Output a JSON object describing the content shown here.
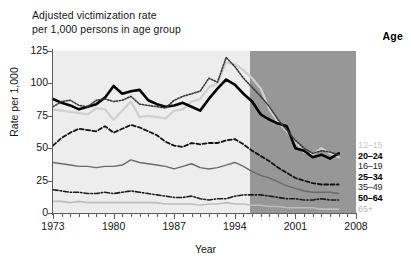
{
  "title": {
    "line1": "Adjusted victimization rate",
    "line2": "per 1,000 persons in age group"
  },
  "legend": {
    "header": "Age",
    "items": [
      {
        "label": "12–15",
        "style": "faint",
        "color": "#d0d0d0"
      },
      {
        "label": "20–24",
        "style": "bold",
        "color": "#000000"
      },
      {
        "label": "16–19",
        "style": "plain",
        "color": "#2a2a2a"
      },
      {
        "label": "25–34",
        "style": "bold",
        "color": "#111111"
      },
      {
        "label": "35–49",
        "style": "plain",
        "color": "#555555"
      },
      {
        "label": "50–64",
        "style": "bold",
        "color": "#222222"
      },
      {
        "label": "65+",
        "style": "faint2",
        "color": "#bdbdbd"
      }
    ]
  },
  "colors": {
    "band_light": "#ededed",
    "band_dark": "#979797",
    "axis": "#5c5c5c",
    "text": "#151515"
  },
  "chart_data": {
    "type": "line",
    "title": "Adjusted victimization rate per 1,000 persons in age group",
    "xlabel": "Year",
    "ylabel": "Rate per 1,000",
    "xlim": [
      1973,
      2008
    ],
    "ylim": [
      0,
      125
    ],
    "yticks": [
      0,
      25,
      50,
      75,
      100,
      125
    ],
    "xticks": [
      1973,
      1980,
      1987,
      1994,
      2001,
      2008
    ],
    "grid": false,
    "legend_position": "right",
    "annotations": [
      {
        "text": "shaded band change at 1994 (survey redesign)",
        "x": 1994
      }
    ],
    "x": [
      1973,
      1974,
      1975,
      1976,
      1977,
      1978,
      1979,
      1980,
      1981,
      1982,
      1983,
      1984,
      1985,
      1986,
      1987,
      1988,
      1989,
      1990,
      1991,
      1992,
      1993,
      1994,
      1995,
      1996,
      1997,
      1998,
      1999,
      2000,
      2001,
      2002,
      2003,
      2004,
      2005,
      2006
    ],
    "series": [
      {
        "name": "12–15",
        "color": "#d0d0d0",
        "dash": "solid",
        "width": 2.2,
        "values": [
          80,
          79,
          78,
          77,
          76,
          81,
          80,
          72,
          79,
          86,
          74,
          75,
          74,
          73,
          79,
          80,
          86,
          88,
          97,
          100,
          116,
          115,
          110,
          104,
          96,
          80,
          70,
          63,
          55,
          47,
          45,
          50,
          46,
          43
        ]
      },
      {
        "name": "20–24",
        "color": "#000000",
        "dash": "solid",
        "width": 2.6,
        "values": [
          88,
          85,
          83,
          80,
          82,
          84,
          89,
          98,
          92,
          94,
          95,
          87,
          84,
          82,
          83,
          85,
          82,
          79,
          88,
          96,
          103,
          99,
          92,
          86,
          76,
          72,
          69,
          67,
          50,
          48,
          43,
          45,
          42,
          46
        ]
      },
      {
        "name": "16–19",
        "color": "#3a3a3a",
        "dash": "dotted",
        "width": 1.6,
        "values": [
          82,
          86,
          87,
          83,
          82,
          87,
          88,
          86,
          87,
          90,
          84,
          83,
          82,
          81,
          87,
          90,
          92,
          94,
          104,
          101,
          120,
          113,
          104,
          97,
          90,
          82,
          72,
          64,
          56,
          50,
          46,
          48,
          47,
          45
        ]
      },
      {
        "name": "25–34",
        "color": "#111111",
        "dash": "dashed",
        "width": 1.8,
        "values": [
          52,
          58,
          62,
          65,
          64,
          63,
          67,
          62,
          65,
          68,
          66,
          63,
          60,
          55,
          52,
          51,
          54,
          53,
          54,
          54,
          56,
          57,
          53,
          48,
          44,
          40,
          35,
          31,
          27,
          25,
          23,
          22,
          22,
          22
        ]
      },
      {
        "name": "35–49",
        "color": "#6a6a6a",
        "dash": "solid",
        "width": 1.4,
        "values": [
          39,
          38,
          37,
          36,
          36,
          35,
          36,
          36,
          37,
          41,
          39,
          38,
          37,
          36,
          34,
          36,
          38,
          35,
          34,
          35,
          37,
          39,
          36,
          32,
          29,
          27,
          24,
          21,
          19,
          17,
          16,
          16,
          16,
          15
        ]
      },
      {
        "name": "50–64",
        "color": "#1d1d1d",
        "dash": "dashdot",
        "width": 1.6,
        "values": [
          18,
          17,
          16,
          16,
          15,
          15,
          16,
          15,
          16,
          17,
          16,
          15,
          14,
          13,
          12,
          12,
          13,
          11,
          10,
          11,
          11,
          13,
          14,
          14,
          14,
          13,
          12,
          11,
          11,
          10,
          10,
          11,
          10,
          10
        ]
      },
      {
        "name": "65+",
        "color": "#bdbdbd",
        "dash": "solid",
        "width": 1.6,
        "values": [
          9,
          9,
          8,
          9,
          8,
          8,
          8,
          8,
          8,
          8,
          8,
          8,
          8,
          7,
          7,
          7,
          7,
          6,
          7,
          7,
          8,
          7,
          7,
          6,
          6,
          5,
          5,
          4,
          4,
          4,
          4,
          3,
          3,
          3
        ]
      }
    ]
  }
}
